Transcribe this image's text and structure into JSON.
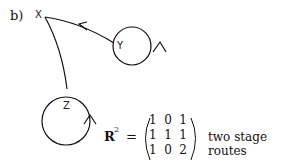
{
  "part_label": "b)",
  "nodes": {
    "x": "X",
    "y": "Y",
    "z": "Z"
  },
  "equation": {
    "lhs": "R",
    "exponent": "2",
    "equals": "=",
    "matrix": [
      [
        "1",
        "0",
        "1"
      ],
      [
        "1",
        "1",
        "1"
      ],
      [
        "1",
        "0",
        "2"
      ]
    ],
    "caption": "two stage routes"
  }
}
